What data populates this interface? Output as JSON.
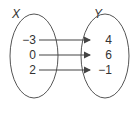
{
  "diagram": {
    "type": "mapping-diagram",
    "domain_label": "X",
    "range_label": "Y",
    "domain_values": [
      "−3",
      "0",
      "2"
    ],
    "range_values": [
      "4",
      "6",
      "−1"
    ],
    "mappings": [
      {
        "from": 0,
        "to": 0
      },
      {
        "from": 1,
        "to": 1
      },
      {
        "from": 2,
        "to": 2
      }
    ],
    "stroke_color": "#444444"
  }
}
